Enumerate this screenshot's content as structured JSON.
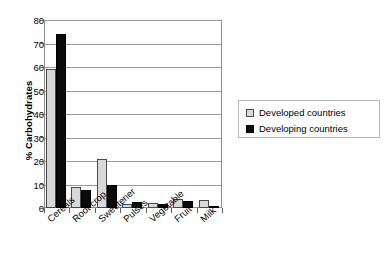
{
  "chart_data": {
    "type": "bar",
    "title": "",
    "xlabel": "",
    "ylabel": "% Carbohydrates",
    "ylim": [
      0,
      80
    ],
    "ytick_step": 10,
    "yticks": [
      0,
      10,
      20,
      30,
      40,
      50,
      60,
      70,
      80
    ],
    "grid": true,
    "legend_position": "right",
    "categories": [
      "Cereals",
      "Root crop",
      "Sweetener",
      "Pulses",
      "Vegetable",
      "Fruit",
      "Milk"
    ],
    "series": [
      {
        "name": "Developed countries",
        "color": "#d8d8d8",
        "values": [
          59,
          9,
          21,
          1.5,
          2,
          4,
          3.5
        ]
      },
      {
        "name": "Developing countries",
        "color": "#0a0a0a",
        "values": [
          74,
          7.5,
          10,
          2.5,
          1.5,
          3,
          0.7
        ]
      }
    ]
  },
  "legend": {
    "items": [
      {
        "label": "Developed countries",
        "swatch": "light-gray-swatch"
      },
      {
        "label": "Developing countries",
        "swatch": "black-swatch"
      }
    ]
  },
  "axes": {
    "y_title": "% Carbohydrates",
    "y_tick_labels": [
      "80",
      "70",
      "60",
      "50",
      "40",
      "30",
      "20",
      "10",
      "0"
    ],
    "x_tick_labels": [
      "Cereals",
      "Root crop",
      "Sweetener",
      "Pulses",
      "Vegetable",
      "Fruit",
      "Milk"
    ]
  }
}
